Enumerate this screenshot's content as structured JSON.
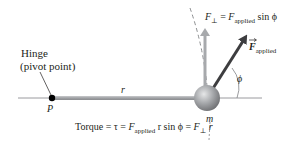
{
  "diagram": {
    "labels": {
      "hinge_line1": "Hinge",
      "hinge_line2": "(pivot point)",
      "pivot": "P",
      "radius": "r",
      "mass": "m",
      "angle": "ϕ",
      "f_perp_symbol": "F",
      "f_perp_sub": "⊥",
      "f_perp_eq": " = ",
      "f_perp_rhs_symbol": "F",
      "f_perp_rhs_sub": "applied",
      "f_perp_rhs_tail": " sin ϕ",
      "f_applied_symbol": "F",
      "f_applied_sub": "applied",
      "torque_prefix": "Torque = τ = ",
      "torque_f": "F",
      "torque_f_sub": "applied",
      "torque_mid": " r sin ϕ = ",
      "torque_fperp": "F",
      "torque_fperp_sub": "⊥",
      "torque_tail": " r"
    },
    "colors": {
      "rod": "#a7a9ac",
      "ball": "#9d9fa2",
      "perp_arrow": "#a7a9ac",
      "applied_arrow": "#3d3d3f",
      "pivot_dot": "#000000",
      "text": "#231f20",
      "dashed_arc": "#808285"
    }
  }
}
